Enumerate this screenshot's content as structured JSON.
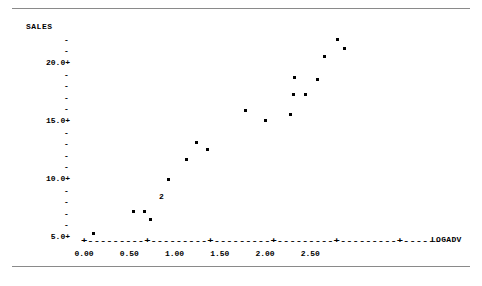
{
  "page": {
    "width": 482,
    "height": 286,
    "background": "#ffffff",
    "ink": "#000000",
    "rule_color": "#8a8a8a"
  },
  "rules": {
    "top_label": "top-divider",
    "bottom_label": "bottom-divider"
  },
  "chart_data": {
    "type": "scatter",
    "title": "",
    "subtitle": "",
    "xlabel": "LOGADV",
    "ylabel": "SALES",
    "xlim": [
      -0.08,
      3.05
    ],
    "ylim": [
      4.0,
      23.0
    ],
    "xticks": [
      0.0,
      0.5,
      1.0,
      1.5,
      2.0,
      2.5
    ],
    "xtick_labels": [
      "0.00",
      "0.50",
      "1.00",
      "1.50",
      "2.00",
      "2.50"
    ],
    "yticks": [
      5.0,
      10.0,
      15.0,
      20.0
    ],
    "ytick_labels": [
      "5.0+",
      "10.0+",
      "15.0+",
      "20.0+"
    ],
    "y_minor_glyph": "-",
    "y_major_glyph": "+",
    "x_axis_glyph_line": "+---------+---------+---------+---------+---------+------",
    "grid": false,
    "legend": null,
    "point_glyph": "*",
    "overlap_label": "2",
    "overlap_note": "A numeral marks a position where 2 observations coincide",
    "points": [
      {
        "x": 0.1,
        "y": 5.2,
        "n": 1
      },
      {
        "x": 0.55,
        "y": 7.1,
        "n": 1
      },
      {
        "x": 0.67,
        "y": 7.1,
        "n": 1
      },
      {
        "x": 0.74,
        "y": 6.4,
        "n": 1
      },
      {
        "x": 0.93,
        "y": 9.9,
        "n": 1
      },
      {
        "x": 1.13,
        "y": 11.6,
        "n": 1
      },
      {
        "x": 1.24,
        "y": 13.1,
        "n": 1
      },
      {
        "x": 1.37,
        "y": 12.5,
        "n": 1
      },
      {
        "x": 1.78,
        "y": 15.8,
        "n": 1
      },
      {
        "x": 2.0,
        "y": 15.0,
        "n": 1
      },
      {
        "x": 2.28,
        "y": 15.5,
        "n": 1
      },
      {
        "x": 2.32,
        "y": 17.2,
        "n": 1
      },
      {
        "x": 2.33,
        "y": 18.7,
        "n": 1
      },
      {
        "x": 2.45,
        "y": 17.2,
        "n": 1
      },
      {
        "x": 2.58,
        "y": 18.5,
        "n": 1
      },
      {
        "x": 2.66,
        "y": 20.5,
        "n": 1
      },
      {
        "x": 2.8,
        "y": 21.9,
        "n": 1
      },
      {
        "x": 2.88,
        "y": 21.2,
        "n": 1
      },
      {
        "x": 0.85,
        "y": 8.35,
        "n": 2
      }
    ]
  },
  "geometry": {
    "x_axis_pixel_y": 240,
    "x0_pixel": 84,
    "x_unit_pixels": 90.5,
    "y5_pixel": 236,
    "y_unit_pixels": 11.6
  }
}
